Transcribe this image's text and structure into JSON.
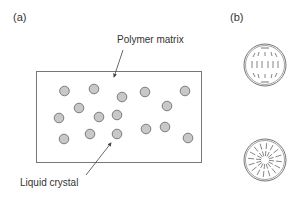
{
  "panels": {
    "a": {
      "label": "(a)"
    },
    "b": {
      "label": "(b)"
    }
  },
  "annotations": {
    "polymer_matrix": "Polymer matrix",
    "liquid_crystal": "Liquid crystal"
  },
  "colors": {
    "stroke": "#666666",
    "droplet_fill": "#c8c8c8",
    "droplet_stroke": "#707070"
  },
  "droplets": [
    [
      64.5,
      91
    ],
    [
      94,
      89
    ],
    [
      122,
      97
    ],
    [
      145,
      92
    ],
    [
      185,
      91
    ],
    [
      79,
      108
    ],
    [
      167,
      106
    ],
    [
      59,
      118
    ],
    [
      99,
      117
    ],
    [
      117,
      115
    ],
    [
      64,
      139
    ],
    [
      90,
      134
    ],
    [
      117,
      134
    ],
    [
      146,
      129
    ],
    [
      165,
      127
    ],
    [
      188,
      138
    ]
  ],
  "configurations": [
    "bipolar",
    "radial"
  ]
}
